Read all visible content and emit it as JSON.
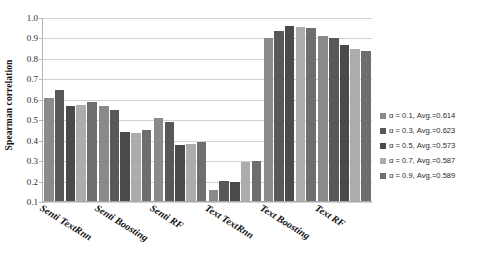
{
  "chart_data": {
    "type": "bar",
    "title": "",
    "xlabel": "",
    "ylabel": "Spearman correlation",
    "ylim": [
      0.1,
      1.0
    ],
    "ytick_step": 0.1,
    "yticks": [
      "1.0",
      "0.9",
      "0.8",
      "0.7",
      "0.6",
      "0.5",
      "0.4",
      "0.3",
      "0.2",
      "0.1"
    ],
    "grid": true,
    "legend_position": "right",
    "categories": [
      "Senti TextRnn",
      "Senti Boosting",
      "Senti RF",
      "Text TextRnn",
      "Text Boosting",
      "Text RF"
    ],
    "series": [
      {
        "name": "α = 0.1, Avg.=0.614",
        "color": "#8a8a8a",
        "values": [
          0.61,
          0.572,
          0.512,
          0.16,
          0.9,
          0.911
        ]
      },
      {
        "name": "α = 0.3, Avg.=0.623",
        "color": "#585858",
        "values": [
          0.646,
          0.549,
          0.489,
          0.201,
          0.936,
          0.9
        ]
      },
      {
        "name": "α = 0.5, Avg.=0.573",
        "color": "#4a4a4a",
        "values": [
          0.572,
          0.441,
          0.378,
          0.2,
          0.961,
          0.866
        ]
      },
      {
        "name": "α = 0.7, Avg.=0.587",
        "color": "#acacac",
        "values": [
          0.574,
          0.44,
          0.385,
          0.298,
          0.954,
          0.85
        ]
      },
      {
        "name": "α = 0.9, Avg.=0.589",
        "color": "#6e6e6e",
        "values": [
          0.587,
          0.452,
          0.392,
          0.299,
          0.949,
          0.84
        ]
      }
    ]
  }
}
